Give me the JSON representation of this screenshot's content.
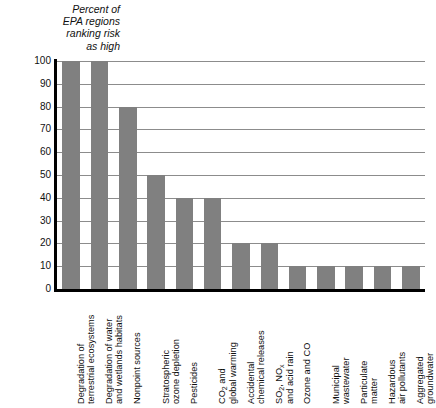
{
  "chart": {
    "title": "Percent of\nEPA regions\nranking risk\nas high",
    "bar_color": "#808080",
    "grid_color": "#8c8c8c",
    "axis_color": "#000000",
    "background": "#ffffff"
  },
  "chart_data": {
    "type": "bar",
    "title": "Percent of EPA regions ranking risk as high",
    "xlabel": "",
    "ylabel": "Percent of EPA regions ranking risk as high",
    "ylim": [
      0,
      100
    ],
    "yticks": [
      0,
      10,
      20,
      30,
      40,
      50,
      60,
      70,
      80,
      90,
      100
    ],
    "ytick_labels": [
      "0",
      "10",
      "20",
      "30",
      "40",
      "50",
      "60",
      "70",
      "80",
      "90",
      "100"
    ],
    "grid": "horizontal",
    "legend": "none",
    "orientation": "vertical",
    "categories": [
      "Degradation of terrestrial ecosystems",
      "Degradation of water and wetlands habitats",
      "Nonpoint sources",
      "Stratospheric ozone depletion",
      "Pesticides",
      "CO2 and global warming",
      "Accidental chemical releases",
      "SO2, NOx and acid rain",
      "Ozone and CO",
      "Municipal wastewater",
      "Particulate matter",
      "Hazardous air pollutants",
      "Aggregated groundwater"
    ],
    "category_lines": [
      [
        "Degradation of",
        "terrestrial ecosystems"
      ],
      [
        "Degradation of water",
        "and wetlands habitats"
      ],
      [
        "Nonpoint sources"
      ],
      [
        "Stratospheric",
        "ozone depletion"
      ],
      [
        "Pesticides"
      ],
      [
        "CO2 and",
        "global warming"
      ],
      [
        "Accidental",
        "chemical releases"
      ],
      [
        "SO2, NOx",
        "and acid rain"
      ],
      [
        "Ozone and CO"
      ],
      [
        "Municipal",
        "wastewater"
      ],
      [
        "Particulate",
        "matter"
      ],
      [
        "Hazardous",
        "air pollutants"
      ],
      [
        "Aggregated",
        "groundwater"
      ]
    ],
    "values": [
      100,
      100,
      80,
      50,
      40,
      40,
      20,
      20,
      10,
      10,
      10,
      10,
      10
    ]
  }
}
